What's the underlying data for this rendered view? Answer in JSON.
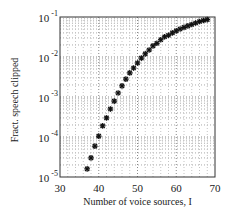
{
  "chart_data": {
    "type": "scatter",
    "title": "",
    "xlabel": "Number of voice sources, I",
    "ylabel": "Fract. speech clipped",
    "xlim": [
      30,
      70
    ],
    "ylim": [
      1e-05,
      0.1
    ],
    "yscale": "log",
    "grid": true,
    "marker": "asterisk",
    "legend": null,
    "x_ticks": [
      "30",
      "40",
      "50",
      "60",
      "70"
    ],
    "y_ticks": [
      {
        "base": "10",
        "exp": "-1"
      },
      {
        "base": "10",
        "exp": "-2"
      },
      {
        "base": "10",
        "exp": "-3"
      },
      {
        "base": "10",
        "exp": "-4"
      },
      {
        "base": "10",
        "exp": "-5"
      }
    ],
    "series": [
      {
        "name": "Fract. speech clipped",
        "x": [
          37,
          38,
          39,
          40,
          41,
          42,
          43,
          44,
          45,
          46,
          47,
          48,
          49,
          50,
          51,
          52,
          53,
          54,
          55,
          56,
          57,
          58,
          59,
          60,
          61,
          62,
          63,
          64,
          65,
          66,
          67,
          68
        ],
        "y": [
          1.6e-05,
          3e-05,
          5.9e-05,
          0.000105,
          0.00019,
          0.0003,
          0.0005,
          0.00079,
          0.00126,
          0.0019,
          0.0028,
          0.004,
          0.0053,
          0.0071,
          0.0094,
          0.012,
          0.015,
          0.019,
          0.022,
          0.027,
          0.032,
          0.035,
          0.04,
          0.045,
          0.05,
          0.055,
          0.06,
          0.065,
          0.071,
          0.077,
          0.082,
          0.086
        ]
      }
    ]
  }
}
